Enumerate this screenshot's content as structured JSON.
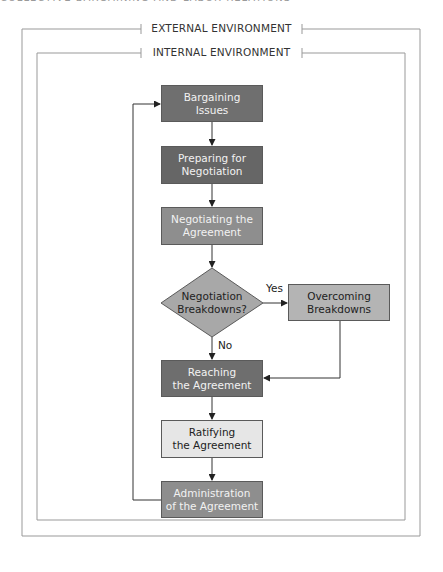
{
  "header": {
    "cut_text": "COLLECTIVE BARGAINING AND LABOR RELATIONS"
  },
  "environments": {
    "external": "EXTERNAL ENVIRONMENT",
    "internal": "INTERNAL ENVIRONMENT"
  },
  "nodes": {
    "bargaining_issues": {
      "line1": "Bargaining",
      "line2": "Issues",
      "color": "#6f6f6f"
    },
    "preparing": {
      "line1": "Preparing for",
      "line2": "Negotiation",
      "color": "#666666"
    },
    "negotiating": {
      "line1": "Negotiating the",
      "line2": "Agreement",
      "color": "#8e8e8e"
    },
    "breakdowns_decision": {
      "line1": "Negotiation",
      "line2": "Breakdowns?",
      "color": "#a8a8a8"
    },
    "overcoming": {
      "line1": "Overcoming",
      "line2": "Breakdowns",
      "color": "#b4b4b4"
    },
    "reaching": {
      "line1": "Reaching",
      "line2": "the Agreement",
      "color": "#6e6e6e"
    },
    "ratifying": {
      "line1": "Ratifying",
      "line2": "the Agreement",
      "color": "#e6e6e6"
    },
    "administration": {
      "line1": "Administration",
      "line2": "of the Agreement",
      "color": "#8e8e8e"
    }
  },
  "edges": {
    "yes": "Yes",
    "no": "No"
  }
}
